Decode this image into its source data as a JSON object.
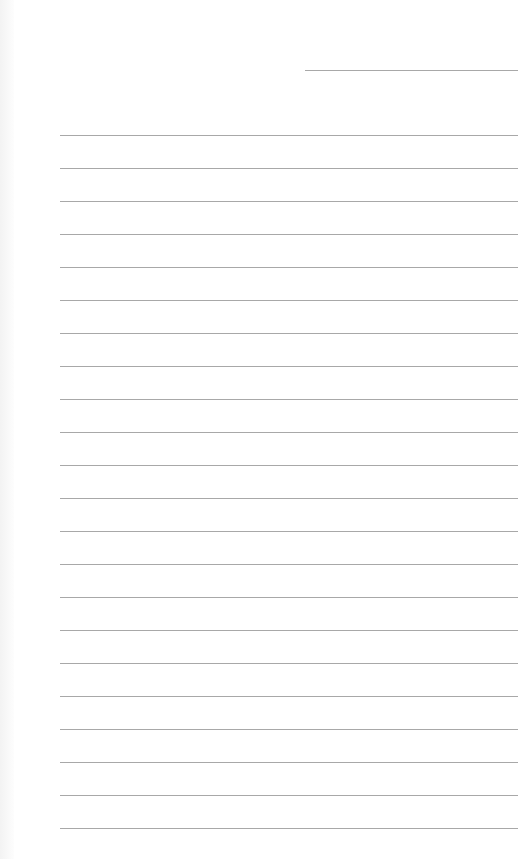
{
  "document": {
    "type": "ruled-sheet",
    "background_color": "#ffffff",
    "line_color": "#a8a8a8",
    "header_line": {
      "x1": 305,
      "x2": 518,
      "y": 70
    },
    "ruled_lines": {
      "count": 22,
      "x1": 60,
      "x2": 518,
      "first_y": 135,
      "spacing": 33
    }
  }
}
